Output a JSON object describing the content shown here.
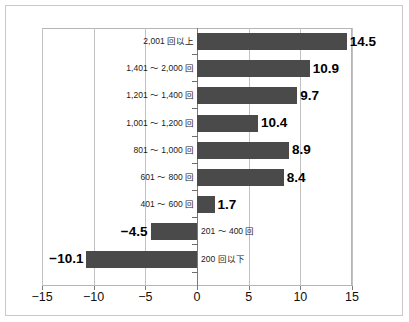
{
  "chart_data": {
    "type": "bar",
    "orientation": "horizontal",
    "title": "",
    "subtitle": "",
    "xlabel": "",
    "ylabel": "",
    "xlim": [
      -15,
      15
    ],
    "xticks": [
      -15,
      -10,
      -5,
      0,
      5,
      10,
      15
    ],
    "xtick_labels": [
      "−15",
      "−10",
      "−5",
      "0",
      "5",
      "10",
      "15"
    ],
    "grid": true,
    "grid_axis": "x",
    "legend": null,
    "legend_position": "none",
    "zero_line": true,
    "bar_color": "#4a4a4a",
    "categories": [
      "2,001 回以上",
      "1,401 ～ 2,000 回",
      "1,201 ～ 1,400 回",
      "1,001 ～ 1,200 回",
      "801 ～ 1,000 回",
      "601 ～ 800 回",
      "401 ～ 600 回",
      "201 ～ 400 回",
      "200 回以下"
    ],
    "values": [
      14.5,
      10.9,
      9.7,
      10.4,
      8.9,
      8.4,
      1.7,
      -4.5,
      -10.1
    ],
    "value_labels": [
      "14.5",
      "10.9",
      "9.7",
      "10.4",
      "8.9",
      "8.4",
      "1.7",
      "−4.5",
      "−10.1"
    ],
    "drawn_bar_lengths": [
      14.5,
      10.9,
      9.7,
      5.9,
      8.9,
      8.4,
      1.7,
      -4.5,
      -10.7
    ],
    "bars": [
      {
        "category": "2,001 回以上",
        "value": 14.5,
        "label": "14.5",
        "drawn": 14.5
      },
      {
        "category": "1,401 ～ 2,000 回",
        "value": 10.9,
        "label": "10.9",
        "drawn": 10.9
      },
      {
        "category": "1,201 ～ 1,400 回",
        "value": 9.7,
        "label": "9.7",
        "drawn": 9.7
      },
      {
        "category": "1,001 ～ 1,200 回",
        "value": 10.4,
        "label": "10.4",
        "drawn": 5.9
      },
      {
        "category": "801 ～ 1,000 回",
        "value": 8.9,
        "label": "8.9",
        "drawn": 8.9
      },
      {
        "category": "601 ～ 800 回",
        "value": 8.4,
        "label": "8.4",
        "drawn": 8.4
      },
      {
        "category": "401 ～ 600 回",
        "value": 1.7,
        "label": "1.7",
        "drawn": 1.7
      },
      {
        "category": "201 ～ 400 回",
        "value": -4.5,
        "label": "−4.5",
        "drawn": -4.5
      },
      {
        "category": "200 回以下",
        "value": -10.1,
        "label": "−10.1",
        "drawn": -10.7
      }
    ]
  }
}
